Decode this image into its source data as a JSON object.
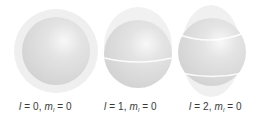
{
  "figure": {
    "orbitals": [
      {
        "l": "0",
        "ml": "0",
        "nodal_lines": 0,
        "label_left": 19
      },
      {
        "l": "1",
        "ml": "0",
        "nodal_lines": 1,
        "label_left": 104
      },
      {
        "l": "2",
        "ml": "0",
        "nodal_lines": 2,
        "label_left": 189
      }
    ],
    "symbols": {
      "l": "l",
      "m": "m",
      "sub": "l",
      "eq": " = ",
      "comma": ", "
    },
    "colors": {
      "sphere": "#d9d9d9",
      "highlight": "#f7f7f7",
      "halo": "#eeeeee",
      "nodal_line": "#ffffff",
      "text": "#3a3a3a"
    }
  }
}
